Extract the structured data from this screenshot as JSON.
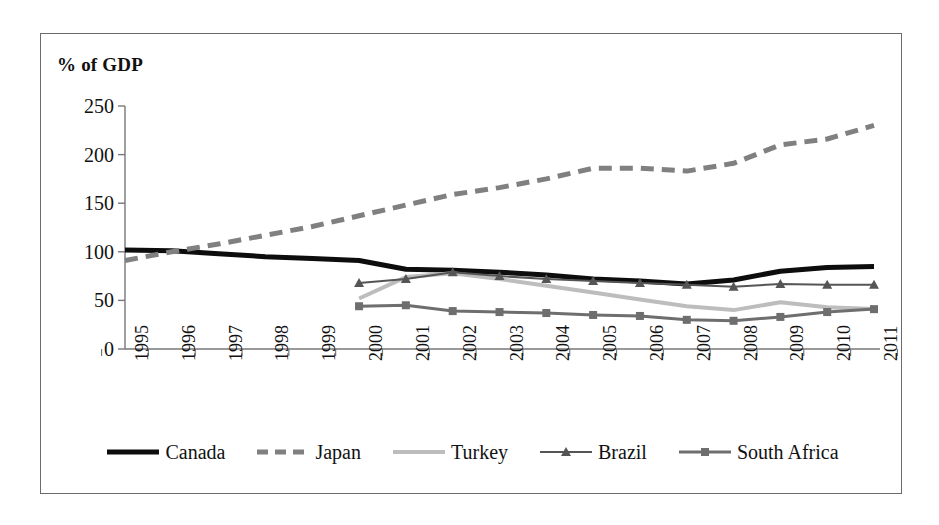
{
  "figure": {
    "axis_title": "% of GDP",
    "border_color": "#6b6b6b"
  },
  "chart_data": {
    "type": "line",
    "title": "",
    "subtitle": "",
    "xlabel": "",
    "ylabel": "% of GDP",
    "categories": [
      "1995",
      "1996",
      "1997",
      "1998",
      "1999",
      "2000",
      "2001",
      "2002",
      "2003",
      "2004",
      "2005",
      "2006",
      "2007",
      "2008",
      "2009",
      "2010",
      "2011"
    ],
    "ylim": [
      0,
      250
    ],
    "yticks": [
      0,
      50,
      100,
      150,
      200,
      250
    ],
    "grid": false,
    "legend_position": "bottom",
    "series": [
      {
        "name": "Canada",
        "color": "#0d0d0d",
        "style": "solid",
        "width": 5,
        "marker": "none",
        "values": [
          102,
          101,
          98,
          95,
          93,
          91,
          82,
          81,
          79,
          76,
          72,
          70,
          67,
          71,
          80,
          84,
          85
        ]
      },
      {
        "name": "Japan",
        "color": "#808080",
        "style": "dashed",
        "width": 5,
        "marker": "none",
        "values": [
          91,
          100,
          108,
          117,
          126,
          137,
          148,
          159,
          166,
          175,
          186,
          186,
          183,
          191,
          210,
          216,
          230
        ]
      },
      {
        "name": "Turkey",
        "color": "#bdbdbd",
        "style": "solid",
        "width": 4,
        "marker": "none",
        "values": [
          null,
          null,
          null,
          null,
          null,
          52,
          74,
          78,
          72,
          65,
          58,
          51,
          44,
          40,
          48,
          43,
          41
        ]
      },
      {
        "name": "Brazil",
        "color": "#555555",
        "style": "solid",
        "width": 2,
        "marker": "triangle",
        "values": [
          null,
          null,
          null,
          null,
          null,
          68,
          72,
          79,
          75,
          72,
          70,
          68,
          66,
          64,
          67,
          66,
          66
        ]
      },
      {
        "name": "South Africa",
        "color": "#6e6e6e",
        "style": "solid",
        "width": 3,
        "marker": "square",
        "values": [
          null,
          null,
          null,
          null,
          null,
          44,
          45,
          39,
          38,
          37,
          35,
          34,
          30,
          29,
          33,
          38,
          41
        ]
      }
    ]
  }
}
